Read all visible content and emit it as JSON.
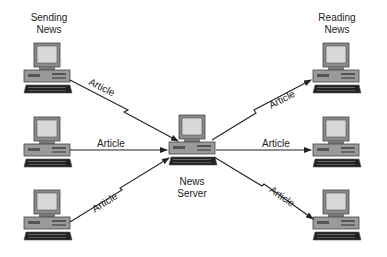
{
  "diagram": {
    "title_left": [
      "Sending",
      "News"
    ],
    "title_right": [
      "Reading",
      "News"
    ],
    "server_label": [
      "News",
      "Server"
    ],
    "edge_label": "Article",
    "nodes": [
      {
        "id": "sender-1",
        "role": "sending"
      },
      {
        "id": "sender-2",
        "role": "sending"
      },
      {
        "id": "sender-3",
        "role": "sending"
      },
      {
        "id": "news-server",
        "role": "server"
      },
      {
        "id": "reader-1",
        "role": "reading"
      },
      {
        "id": "reader-2",
        "role": "reading"
      },
      {
        "id": "reader-3",
        "role": "reading"
      }
    ],
    "edges": [
      {
        "from": "sender-1",
        "to": "news-server",
        "label": "Article",
        "style": "lightning"
      },
      {
        "from": "sender-2",
        "to": "news-server",
        "label": "Article",
        "style": "straight"
      },
      {
        "from": "sender-3",
        "to": "news-server",
        "label": "Article",
        "style": "lightning"
      },
      {
        "from": "news-server",
        "to": "reader-1",
        "label": "Article",
        "style": "lightning"
      },
      {
        "from": "news-server",
        "to": "reader-2",
        "label": "Article",
        "style": "straight"
      },
      {
        "from": "news-server",
        "to": "reader-3",
        "label": "Article",
        "style": "lightning"
      }
    ]
  }
}
